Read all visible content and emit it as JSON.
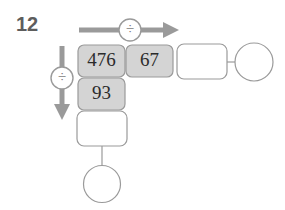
{
  "problem": {
    "number": "12"
  },
  "operations": {
    "row_operator": {
      "symbol": "÷",
      "name": "division",
      "direction": "right"
    },
    "column_operator": {
      "symbol": "÷",
      "name": "division",
      "direction": "down"
    }
  },
  "grid": {
    "row1": {
      "cell1": {
        "value": "476",
        "filled": true
      },
      "cell2": {
        "value": "67",
        "filled": true
      },
      "cell3": {
        "value": "",
        "filled": false
      },
      "answer": {
        "value": "",
        "shape": "circle"
      }
    },
    "col1": {
      "cell2": {
        "value": "93",
        "filled": true
      },
      "cell3": {
        "value": "",
        "filled": false
      },
      "answer": {
        "value": "",
        "shape": "circle"
      }
    }
  },
  "colors": {
    "cell_fill": "#d4d4d4",
    "cell_empty_fill": "#ffffff",
    "stroke": "#9a9a9a",
    "arrow": "#9a9a9a",
    "text": "#2b2b2b",
    "number_label": "#5d5d5d",
    "background": "#ffffff"
  }
}
